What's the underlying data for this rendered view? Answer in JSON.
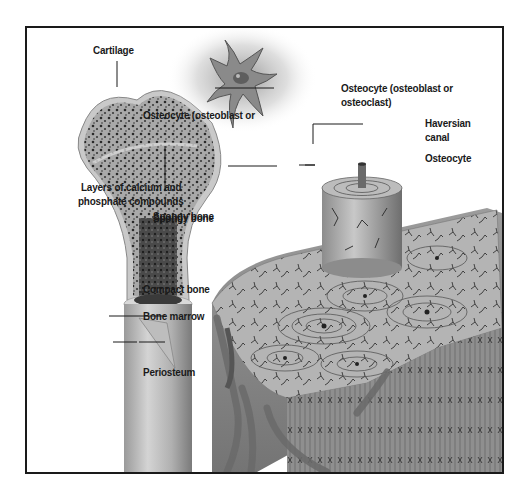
{
  "figure": {
    "background": "#ffffff",
    "frame_color": "#1a1a1a",
    "illustration_tone": "grayscale"
  },
  "labels": {
    "cartilage": "Cartilage",
    "spongy_bone": "Spongy bone",
    "compact_bone": "Compact bone",
    "bone_marrow": "Bone marrow",
    "periosteum": "Periosteum",
    "osteocyte_cell_line1": "Osteocyte (osteoblast or",
    "osteocyte_cell_line2": "osteoclast)",
    "haversian_line1": "Haversian",
    "haversian_line2": "canal",
    "osteocyte": "Osteocyte",
    "layers_line1": "Layers of calcium and",
    "layers_line2": "phosphate compounds"
  },
  "structures": [
    {
      "name": "long-bone-cross-section",
      "region": "left"
    },
    {
      "name": "osteocyte-cell",
      "region": "top-center"
    },
    {
      "name": "osteon-cylinder",
      "region": "right-center"
    },
    {
      "name": "compact-bone-block",
      "region": "bottom-right"
    }
  ]
}
